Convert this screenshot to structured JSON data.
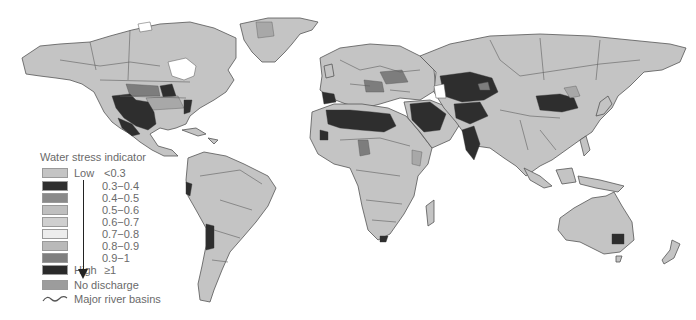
{
  "legend": {
    "title": "Water stress indicator",
    "items": [
      {
        "end_label": "Low",
        "range": "<0.3",
        "color": "#c4c4c4"
      },
      {
        "end_label": "",
        "range": "0.3−0.4",
        "color": "#2f2f2f"
      },
      {
        "end_label": "",
        "range": "0.4−0.5",
        "color": "#8a8a8a"
      },
      {
        "end_label": "",
        "range": "0.5−0.6",
        "color": "#bfbfbf"
      },
      {
        "end_label": "",
        "range": "0.6−0.7",
        "color": "#cfcfcf"
      },
      {
        "end_label": "",
        "range": "0.7−0.8",
        "color": "#ededed"
      },
      {
        "end_label": "",
        "range": "0.8−0.9",
        "color": "#b9b9b9"
      },
      {
        "end_label": "",
        "range": "0.9−1",
        "color": "#7f7f7f"
      },
      {
        "end_label": "High",
        "range": "≥1",
        "color": "#2a2a2a"
      }
    ],
    "no_discharge": {
      "label": "No discharge",
      "color": "#9c9c9c"
    },
    "river_basins": {
      "label": "Major river basins",
      "icon": "wavy-line-icon"
    }
  },
  "map": {
    "land_color": "#c4c4c4",
    "ocean_color": "#ffffff",
    "high_stress_color": "#2e2e2e",
    "regions": [
      "North America",
      "South America",
      "Europe",
      "Africa",
      "Asia",
      "Australia",
      "Greenland"
    ]
  }
}
